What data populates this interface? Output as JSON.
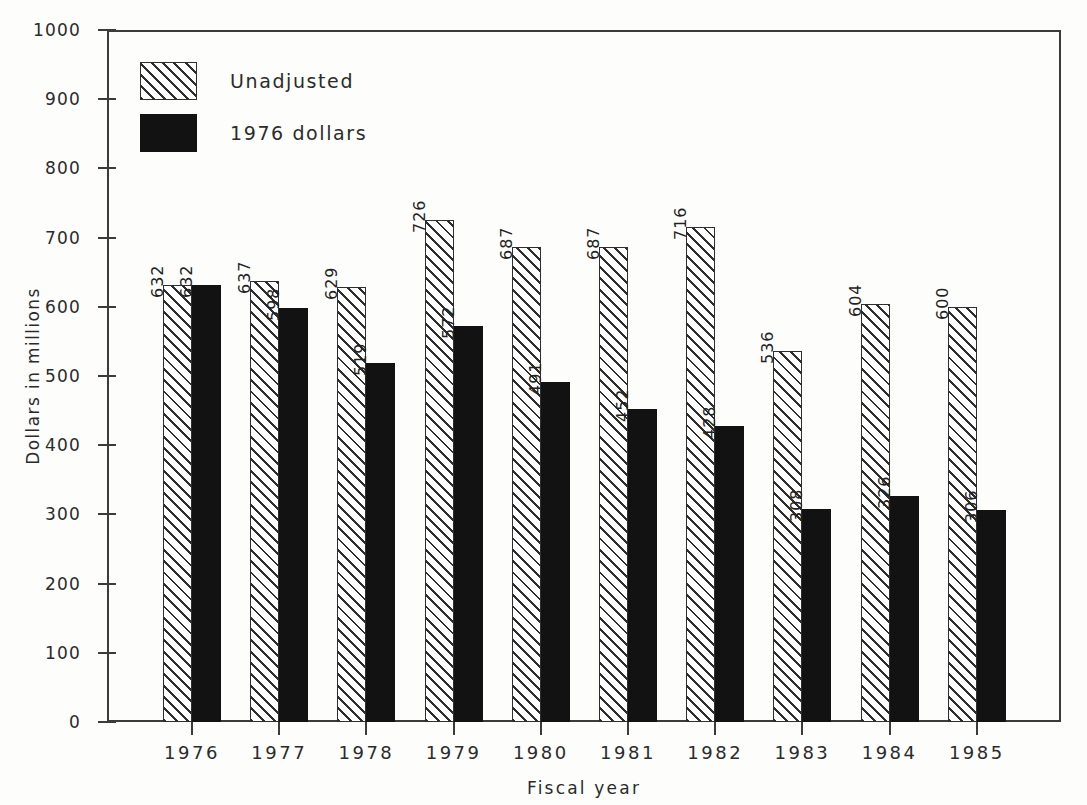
{
  "chart_data": {
    "type": "bar",
    "title": "",
    "xlabel": "Fiscal year",
    "ylabel": "Dollars in millions",
    "ylim": [
      0,
      1000
    ],
    "ytick_step": 100,
    "yticks": [
      "0",
      "100",
      "200",
      "300",
      "400",
      "500",
      "600",
      "700",
      "800",
      "900",
      "1000"
    ],
    "categories": [
      "1976",
      "1977",
      "1978",
      "1979",
      "1980",
      "1981",
      "1982",
      "1983",
      "1984",
      "1985"
    ],
    "grid": false,
    "legend_position": "upper-left-inside",
    "series": [
      {
        "name": "Unadjusted",
        "fill": "hatched",
        "values": [
          632,
          637,
          629,
          726,
          687,
          687,
          716,
          536,
          604,
          600
        ]
      },
      {
        "name": "1976 dollars",
        "fill": "solid-black",
        "values": [
          632,
          598,
          519,
          572,
          491,
          452,
          428,
          308,
          326,
          306
        ]
      }
    ]
  },
  "legend": {
    "items": [
      {
        "label": "Unadjusted",
        "swatch": "hatched-swatch"
      },
      {
        "label": "1976 dollars",
        "swatch": "solid-black-swatch"
      }
    ]
  },
  "colors": {
    "axis": "#3b3b3b",
    "text": "#2b2b2b",
    "series_adjusted": "#121212",
    "series_unadjusted_line": "#2e2e2e",
    "background": "#fdfdfc"
  }
}
